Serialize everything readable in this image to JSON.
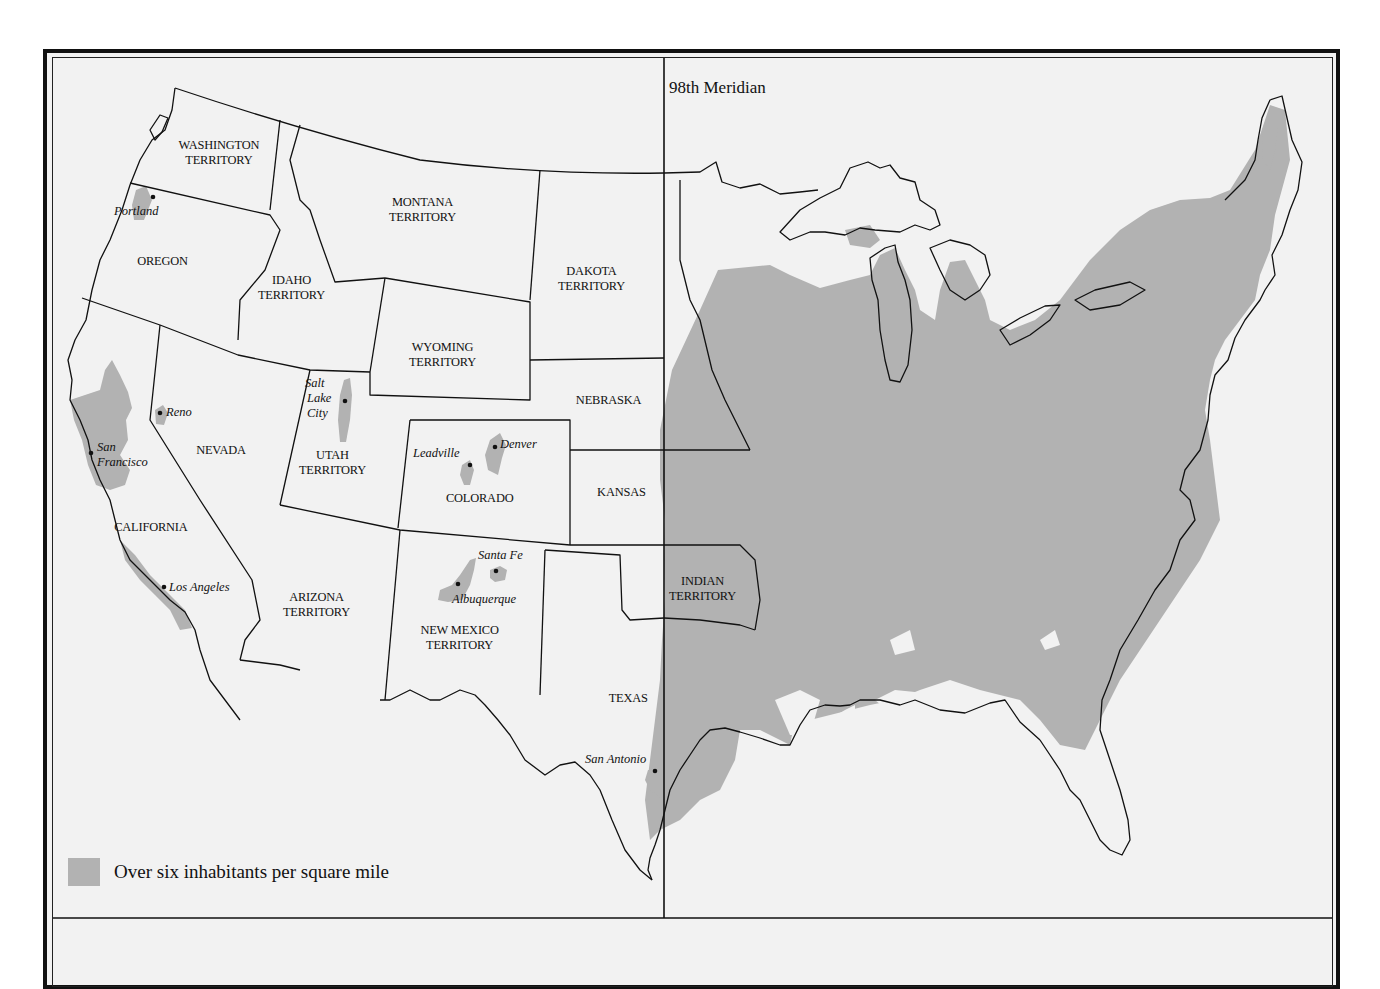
{
  "map": {
    "meridian_label": "98th Meridian",
    "legend": {
      "swatch_color": "#b2b2b2",
      "label": "Over six inhabitants per square mile"
    },
    "colors": {
      "background": "#f2f2f2",
      "shaded": "#b2b2b2",
      "lines": "#111111"
    },
    "regions": {
      "washington": [
        "WASHINGTON",
        "TERRITORY"
      ],
      "montana": [
        "MONTANA",
        "TERRITORY"
      ],
      "oregon": [
        "OREGON"
      ],
      "idaho": [
        "IDAHO",
        "TERRITORY"
      ],
      "dakota": [
        "DAKOTA",
        "TERRITORY"
      ],
      "wyoming": [
        "WYOMING",
        "TERRITORY"
      ],
      "nebraska": [
        "NEBRASKA"
      ],
      "nevada": [
        "NEVADA"
      ],
      "utah": [
        "UTAH",
        "TERRITORY"
      ],
      "colorado": [
        "COLORADO"
      ],
      "kansas": [
        "KANSAS"
      ],
      "california": [
        "CALIFORNIA"
      ],
      "arizona": [
        "ARIZONA",
        "TERRITORY"
      ],
      "new_mexico": [
        "NEW MEXICO",
        "TERRITORY"
      ],
      "indian": [
        "INDIAN",
        "TERRITORY"
      ],
      "texas": [
        "TEXAS"
      ]
    },
    "cities": {
      "portland": "Portland",
      "reno": "Reno",
      "salt_lake": [
        "Salt",
        "Lake",
        "City"
      ],
      "san_francisco": [
        "San",
        "Francisco"
      ],
      "leadville": "Leadville",
      "denver": "Denver",
      "los_angeles": "Los Angeles",
      "santa_fe": "Santa Fe",
      "albuquerque": "Albuquerque",
      "san_antonio": "San Antonio"
    }
  }
}
